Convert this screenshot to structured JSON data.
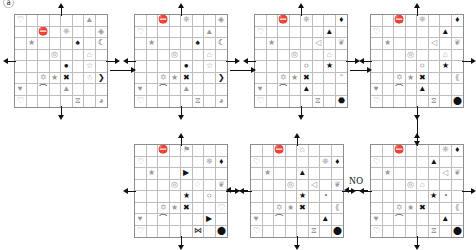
{
  "figure": {
    "title": "",
    "corner_mark": "ⓐ",
    "grid_rows": 8,
    "grid_cols": 8,
    "no_labels": [
      "NO"
    ],
    "colors": {
      "grid_line": "#bdbdbd",
      "grid_border": "#8d8d8d",
      "arrow": "#111111",
      "symbol_dark": "#111111",
      "symbol_grey": "#9a9a9a"
    }
  },
  "panels": [
    {
      "id": "panel-1",
      "name": "grid-1",
      "position": {
        "x": 14,
        "y": 14
      },
      "axes": {
        "up": true,
        "down": true,
        "left": true,
        "right": true
      },
      "symbols": [
        {
          "r": 0,
          "c": 0,
          "glyph": "♡",
          "cls": "g"
        },
        {
          "r": 0,
          "c": 6,
          "glyph": "▲",
          "cls": "g"
        },
        {
          "r": 1,
          "c": 2,
          "glyph": "⛔",
          "cls": "k"
        },
        {
          "r": 1,
          "c": 4,
          "glyph": "❈",
          "cls": "g"
        },
        {
          "r": 1,
          "c": 7,
          "glyph": "◈",
          "cls": "g"
        },
        {
          "r": 2,
          "c": 1,
          "glyph": "★",
          "cls": "g"
        },
        {
          "r": 2,
          "c": 5,
          "glyph": "♠",
          "cls": "k"
        },
        {
          "r": 2,
          "c": 7,
          "glyph": "☾",
          "cls": "k"
        },
        {
          "r": 3,
          "c": 3,
          "glyph": "◎",
          "cls": "g"
        },
        {
          "r": 3,
          "c": 6,
          "glyph": "⌂",
          "cls": "g"
        },
        {
          "r": 4,
          "c": 4,
          "glyph": "●",
          "cls": "k"
        },
        {
          "r": 4,
          "c": 6,
          "glyph": "☆",
          "cls": "g"
        },
        {
          "r": 5,
          "c": 2,
          "glyph": "✡",
          "cls": "g"
        },
        {
          "r": 5,
          "c": 3,
          "glyph": "★",
          "cls": "g"
        },
        {
          "r": 5,
          "c": 4,
          "glyph": "✖",
          "cls": "k"
        },
        {
          "r": 5,
          "c": 6,
          "glyph": "☃",
          "cls": "g"
        },
        {
          "r": 5,
          "c": 7,
          "glyph": "❯",
          "cls": "k"
        },
        {
          "r": 6,
          "c": 0,
          "glyph": "♥",
          "cls": "g"
        },
        {
          "r": 6,
          "c": 2,
          "glyph": "⌒",
          "cls": "k"
        },
        {
          "r": 6,
          "c": 4,
          "glyph": "▲",
          "cls": "g"
        },
        {
          "r": 7,
          "c": 0,
          "glyph": "♡",
          "cls": "g"
        },
        {
          "r": 7,
          "c": 5,
          "glyph": "⧖",
          "cls": "g"
        },
        {
          "r": 7,
          "c": 7,
          "glyph": "◕",
          "cls": "g"
        }
      ]
    },
    {
      "id": "panel-2",
      "name": "grid-2",
      "position": {
        "x": 134,
        "y": 14
      },
      "axes": {
        "up": true,
        "down": true,
        "left": true,
        "right": true
      },
      "symbols": [
        {
          "r": 0,
          "c": 2,
          "glyph": "⛔",
          "cls": "k"
        },
        {
          "r": 0,
          "c": 4,
          "glyph": "❈",
          "cls": "g"
        },
        {
          "r": 0,
          "c": 7,
          "glyph": "◈",
          "cls": "g"
        },
        {
          "r": 1,
          "c": 0,
          "glyph": "♡",
          "cls": "g"
        },
        {
          "r": 1,
          "c": 6,
          "glyph": "▲",
          "cls": "g"
        },
        {
          "r": 2,
          "c": 1,
          "glyph": "★",
          "cls": "g"
        },
        {
          "r": 2,
          "c": 5,
          "glyph": "♠",
          "cls": "k"
        },
        {
          "r": 2,
          "c": 7,
          "glyph": "☾",
          "cls": "k"
        },
        {
          "r": 3,
          "c": 3,
          "glyph": "◎",
          "cls": "g"
        },
        {
          "r": 3,
          "c": 6,
          "glyph": "⌂",
          "cls": "g"
        },
        {
          "r": 4,
          "c": 4,
          "glyph": "●",
          "cls": "k"
        },
        {
          "r": 4,
          "c": 6,
          "glyph": "☆",
          "cls": "g"
        },
        {
          "r": 5,
          "c": 2,
          "glyph": "✡",
          "cls": "g"
        },
        {
          "r": 5,
          "c": 3,
          "glyph": "★",
          "cls": "g"
        },
        {
          "r": 5,
          "c": 4,
          "glyph": "✖",
          "cls": "k"
        },
        {
          "r": 5,
          "c": 7,
          "glyph": "❯",
          "cls": "k"
        },
        {
          "r": 6,
          "c": 0,
          "glyph": "♥",
          "cls": "g"
        },
        {
          "r": 6,
          "c": 2,
          "glyph": "⌒",
          "cls": "k"
        },
        {
          "r": 6,
          "c": 4,
          "glyph": "▲",
          "cls": "g"
        },
        {
          "r": 7,
          "c": 0,
          "glyph": "♡",
          "cls": "g"
        },
        {
          "r": 7,
          "c": 5,
          "glyph": "⧖",
          "cls": "g"
        },
        {
          "r": 7,
          "c": 7,
          "glyph": "◕",
          "cls": "g"
        }
      ]
    },
    {
      "id": "panel-3",
      "name": "grid-3",
      "position": {
        "x": 254,
        "y": 14
      },
      "axes": {
        "up": true,
        "down": true,
        "left": true,
        "right": true
      },
      "symbols": [
        {
          "r": 0,
          "c": 2,
          "glyph": "⛔",
          "cls": "k"
        },
        {
          "r": 0,
          "c": 4,
          "glyph": "❈",
          "cls": "g"
        },
        {
          "r": 0,
          "c": 7,
          "glyph": "♦",
          "cls": "k"
        },
        {
          "r": 1,
          "c": 0,
          "glyph": "♡",
          "cls": "g"
        },
        {
          "r": 1,
          "c": 6,
          "glyph": "▲",
          "cls": "k"
        },
        {
          "r": 2,
          "c": 1,
          "glyph": "★",
          "cls": "g"
        },
        {
          "r": 2,
          "c": 5,
          "glyph": "◁",
          "cls": "g"
        },
        {
          "r": 2,
          "c": 7,
          "glyph": "❦",
          "cls": "g"
        },
        {
          "r": 3,
          "c": 3,
          "glyph": "◎",
          "cls": "g"
        },
        {
          "r": 3,
          "c": 6,
          "glyph": "⌂",
          "cls": "g"
        },
        {
          "r": 4,
          "c": 4,
          "glyph": "○",
          "cls": "o"
        },
        {
          "r": 4,
          "c": 6,
          "glyph": "★",
          "cls": "k"
        },
        {
          "r": 5,
          "c": 2,
          "glyph": "✡",
          "cls": "g"
        },
        {
          "r": 5,
          "c": 3,
          "glyph": "★",
          "cls": "g"
        },
        {
          "r": 5,
          "c": 4,
          "glyph": "✖",
          "cls": "k"
        },
        {
          "r": 5,
          "c": 7,
          "glyph": "⌃",
          "cls": "g"
        },
        {
          "r": 6,
          "c": 0,
          "glyph": "♥",
          "cls": "g"
        },
        {
          "r": 6,
          "c": 2,
          "glyph": "⌒",
          "cls": "k"
        },
        {
          "r": 6,
          "c": 4,
          "glyph": "▲",
          "cls": "k"
        },
        {
          "r": 7,
          "c": 0,
          "glyph": "♡",
          "cls": "g"
        },
        {
          "r": 7,
          "c": 5,
          "glyph": "⧖",
          "cls": "g"
        },
        {
          "r": 7,
          "c": 7,
          "glyph": "⬣",
          "cls": "k"
        }
      ]
    },
    {
      "id": "panel-4",
      "name": "grid-4",
      "position": {
        "x": 370,
        "y": 14
      },
      "axes": {
        "up": true,
        "down": true,
        "left": true,
        "right": true
      },
      "symbols": [
        {
          "r": 0,
          "c": 2,
          "glyph": "⛔",
          "cls": "k"
        },
        {
          "r": 0,
          "c": 4,
          "glyph": "❈",
          "cls": "g"
        },
        {
          "r": 0,
          "c": 7,
          "glyph": "♦",
          "cls": "k"
        },
        {
          "r": 1,
          "c": 0,
          "glyph": "♡",
          "cls": "g"
        },
        {
          "r": 1,
          "c": 6,
          "glyph": "▲",
          "cls": "k"
        },
        {
          "r": 2,
          "c": 1,
          "glyph": "★",
          "cls": "g"
        },
        {
          "r": 2,
          "c": 5,
          "glyph": "◁",
          "cls": "g"
        },
        {
          "r": 2,
          "c": 7,
          "glyph": "❦",
          "cls": "g"
        },
        {
          "r": 3,
          "c": 3,
          "glyph": "◎",
          "cls": "g"
        },
        {
          "r": 3,
          "c": 6,
          "glyph": "⌂",
          "cls": "g"
        },
        {
          "r": 4,
          "c": 4,
          "glyph": "○",
          "cls": "o"
        },
        {
          "r": 4,
          "c": 6,
          "glyph": "★",
          "cls": "k"
        },
        {
          "r": 5,
          "c": 2,
          "glyph": "✡",
          "cls": "g"
        },
        {
          "r": 5,
          "c": 3,
          "glyph": "★",
          "cls": "g"
        },
        {
          "r": 5,
          "c": 4,
          "glyph": "✖",
          "cls": "k"
        },
        {
          "r": 5,
          "c": 7,
          "glyph": "⟪",
          "cls": "g"
        },
        {
          "r": 6,
          "c": 0,
          "glyph": "♥",
          "cls": "g"
        },
        {
          "r": 6,
          "c": 2,
          "glyph": "⌒",
          "cls": "k"
        },
        {
          "r": 6,
          "c": 4,
          "glyph": "▲",
          "cls": "k"
        },
        {
          "r": 7,
          "c": 0,
          "glyph": "♡",
          "cls": "g"
        },
        {
          "r": 7,
          "c": 5,
          "glyph": "⧖",
          "cls": "g"
        },
        {
          "r": 7,
          "c": 7,
          "glyph": "⬤",
          "cls": "k"
        }
      ]
    },
    {
      "id": "panel-5",
      "name": "grid-5",
      "position": {
        "x": 370,
        "y": 144
      },
      "axes": {
        "up": true,
        "down": true,
        "left": true,
        "right": true
      },
      "symbols": [
        {
          "r": 0,
          "c": 2,
          "glyph": "⛔",
          "cls": "k"
        },
        {
          "r": 0,
          "c": 6,
          "glyph": "❈",
          "cls": "g"
        },
        {
          "r": 0,
          "c": 7,
          "glyph": "♦",
          "cls": "k"
        },
        {
          "r": 1,
          "c": 0,
          "glyph": "♡",
          "cls": "g"
        },
        {
          "r": 1,
          "c": 5,
          "glyph": "▲",
          "cls": "k"
        },
        {
          "r": 2,
          "c": 1,
          "glyph": "★",
          "cls": "g"
        },
        {
          "r": 2,
          "c": 6,
          "glyph": "◁",
          "cls": "g"
        },
        {
          "r": 2,
          "c": 7,
          "glyph": "❦",
          "cls": "g"
        },
        {
          "r": 3,
          "c": 3,
          "glyph": "◎",
          "cls": "g"
        },
        {
          "r": 3,
          "c": 4,
          "glyph": "⌂",
          "cls": "g"
        },
        {
          "r": 4,
          "c": 5,
          "glyph": "★",
          "cls": "k"
        },
        {
          "r": 4,
          "c": 6,
          "glyph": "◔",
          "cls": "o"
        },
        {
          "r": 5,
          "c": 2,
          "glyph": "✡",
          "cls": "g"
        },
        {
          "r": 5,
          "c": 3,
          "glyph": "★",
          "cls": "g"
        },
        {
          "r": 5,
          "c": 4,
          "glyph": "✖",
          "cls": "k"
        },
        {
          "r": 5,
          "c": 7,
          "glyph": "⟪",
          "cls": "g"
        },
        {
          "r": 6,
          "c": 0,
          "glyph": "♥",
          "cls": "g"
        },
        {
          "r": 6,
          "c": 2,
          "glyph": "⌒",
          "cls": "k"
        },
        {
          "r": 6,
          "c": 6,
          "glyph": "▲",
          "cls": "k"
        },
        {
          "r": 7,
          "c": 0,
          "glyph": "♡",
          "cls": "g"
        },
        {
          "r": 7,
          "c": 5,
          "glyph": "⧖",
          "cls": "g"
        },
        {
          "r": 7,
          "c": 7,
          "glyph": "⬤",
          "cls": "k"
        }
      ]
    },
    {
      "id": "panel-6",
      "name": "grid-6",
      "position": {
        "x": 250,
        "y": 144
      },
      "axes": {
        "up": true,
        "down": true,
        "left": true,
        "right": true
      },
      "symbols": [
        {
          "r": 0,
          "c": 2,
          "glyph": "⛔",
          "cls": "k"
        },
        {
          "r": 0,
          "c": 4,
          "glyph": "⌂",
          "cls": "g"
        },
        {
          "r": 1,
          "c": 0,
          "glyph": "♡",
          "cls": "g"
        },
        {
          "r": 1,
          "c": 6,
          "glyph": "❈",
          "cls": "g"
        },
        {
          "r": 1,
          "c": 7,
          "glyph": "♦",
          "cls": "k"
        },
        {
          "r": 2,
          "c": 1,
          "glyph": "★",
          "cls": "g"
        },
        {
          "r": 2,
          "c": 4,
          "glyph": "▲",
          "cls": "k"
        },
        {
          "r": 3,
          "c": 3,
          "glyph": "◎",
          "cls": "g"
        },
        {
          "r": 3,
          "c": 5,
          "glyph": "◁",
          "cls": "g"
        },
        {
          "r": 3,
          "c": 7,
          "glyph": "❦",
          "cls": "g"
        },
        {
          "r": 4,
          "c": 4,
          "glyph": "★",
          "cls": "k"
        },
        {
          "r": 4,
          "c": 6,
          "glyph": "◔",
          "cls": "o"
        },
        {
          "r": 5,
          "c": 2,
          "glyph": "✡",
          "cls": "g"
        },
        {
          "r": 5,
          "c": 3,
          "glyph": "★",
          "cls": "g"
        },
        {
          "r": 5,
          "c": 4,
          "glyph": "✖",
          "cls": "k"
        },
        {
          "r": 5,
          "c": 7,
          "glyph": "⟪",
          "cls": "g"
        },
        {
          "r": 6,
          "c": 0,
          "glyph": "♥",
          "cls": "g"
        },
        {
          "r": 6,
          "c": 2,
          "glyph": "⌒",
          "cls": "k"
        },
        {
          "r": 6,
          "c": 6,
          "glyph": "▲",
          "cls": "k"
        },
        {
          "r": 7,
          "c": 0,
          "glyph": "♡",
          "cls": "g"
        },
        {
          "r": 7,
          "c": 5,
          "glyph": "⧖",
          "cls": "g"
        },
        {
          "r": 7,
          "c": 7,
          "glyph": "⬤",
          "cls": "k"
        }
      ]
    },
    {
      "id": "panel-7",
      "name": "grid-7",
      "position": {
        "x": 134,
        "y": 144
      },
      "axes": {
        "up": true,
        "down": true,
        "left": true,
        "right": true
      },
      "symbols": [
        {
          "r": 0,
          "c": 2,
          "glyph": "⛔",
          "cls": "k"
        },
        {
          "r": 0,
          "c": 4,
          "glyph": "⚑",
          "cls": "g"
        },
        {
          "r": 1,
          "c": 0,
          "glyph": "♡",
          "cls": "g"
        },
        {
          "r": 1,
          "c": 6,
          "glyph": "❈",
          "cls": "g"
        },
        {
          "r": 1,
          "c": 7,
          "glyph": "♦",
          "cls": "k"
        },
        {
          "r": 2,
          "c": 1,
          "glyph": "★",
          "cls": "g"
        },
        {
          "r": 2,
          "c": 4,
          "glyph": "▶",
          "cls": "k"
        },
        {
          "r": 3,
          "c": 3,
          "glyph": "◎",
          "cls": "g"
        },
        {
          "r": 3,
          "c": 5,
          "glyph": "♢",
          "cls": "g"
        },
        {
          "r": 3,
          "c": 7,
          "glyph": "❦",
          "cls": "g"
        },
        {
          "r": 4,
          "c": 4,
          "glyph": "★",
          "cls": "k"
        },
        {
          "r": 4,
          "c": 6,
          "glyph": "○",
          "cls": "o"
        },
        {
          "r": 5,
          "c": 2,
          "glyph": "✡",
          "cls": "g"
        },
        {
          "r": 5,
          "c": 3,
          "glyph": "★",
          "cls": "g"
        },
        {
          "r": 5,
          "c": 4,
          "glyph": "✖",
          "cls": "k"
        },
        {
          "r": 5,
          "c": 7,
          "glyph": "♡",
          "cls": "g"
        },
        {
          "r": 6,
          "c": 0,
          "glyph": "♥",
          "cls": "g"
        },
        {
          "r": 6,
          "c": 2,
          "glyph": "⌒",
          "cls": "k"
        },
        {
          "r": 6,
          "c": 6,
          "glyph": "▶",
          "cls": "k"
        },
        {
          "r": 7,
          "c": 0,
          "glyph": "♡",
          "cls": "g"
        },
        {
          "r": 7,
          "c": 5,
          "glyph": "⋈",
          "cls": "k"
        },
        {
          "r": 7,
          "c": 7,
          "glyph": "⬤",
          "cls": "k"
        }
      ]
    }
  ],
  "connectors": [
    {
      "id": "conn-1-2",
      "name": "arrow-grid1-to-grid2",
      "dir": "right",
      "x": 110,
      "y": 70,
      "len": 22
    },
    {
      "id": "conn-2-3",
      "name": "arrow-grid2-to-grid3",
      "dir": "right",
      "x": 230,
      "y": 70,
      "len": 22
    },
    {
      "id": "conn-3-4",
      "name": "arrow-grid3-to-grid4",
      "dir": "right",
      "x": 350,
      "y": 70,
      "len": 18
    },
    {
      "id": "conn-4-5",
      "name": "arrow-grid4-to-grid5",
      "dir": "down",
      "x": 417,
      "y": 112,
      "len": 30
    },
    {
      "id": "conn-5-6",
      "name": "arrow-grid5-to-grid6",
      "dir": "left",
      "x": 348,
      "y": 190,
      "len": 20
    },
    {
      "id": "conn-6-7",
      "name": "arrow-grid6-to-grid7",
      "dir": "left",
      "x": 230,
      "y": 190,
      "len": 18
    }
  ]
}
